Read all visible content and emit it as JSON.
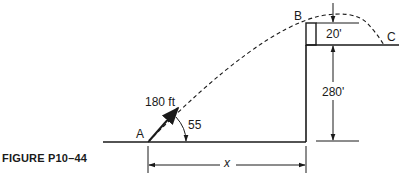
{
  "figure": {
    "caption": "FIGURE P10–44",
    "points": {
      "A": "A",
      "B": "B",
      "C": "C"
    },
    "labels": {
      "velocity": "180 ft",
      "angle": "55",
      "cliff_height": "280'",
      "ledge_height": "20'",
      "horizontal_distance": "x"
    }
  },
  "colors": {
    "ink": "#1a1a1a",
    "background": "#ffffff"
  }
}
